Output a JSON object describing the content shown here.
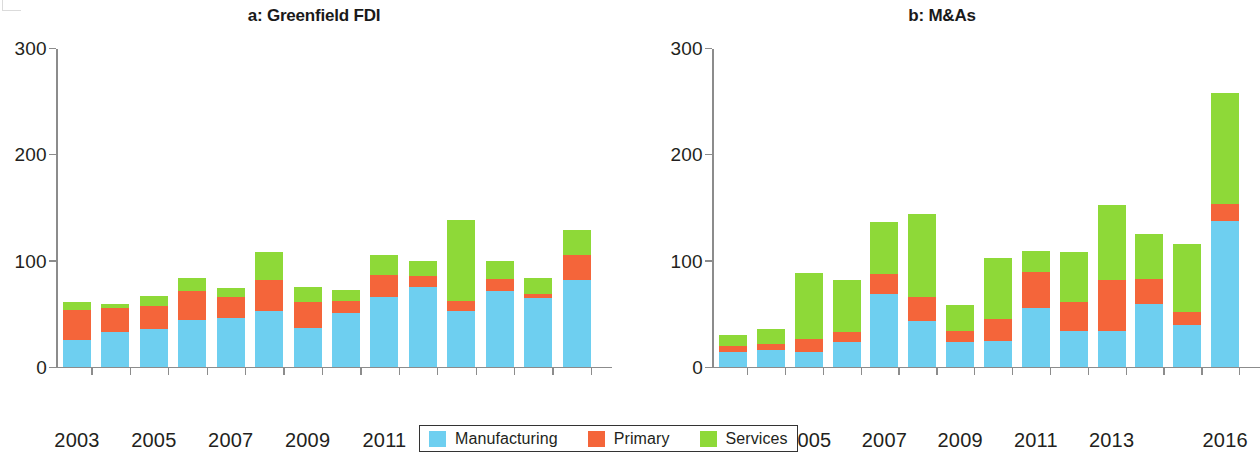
{
  "figure": {
    "panels": [
      {
        "id": "a",
        "title": "a: Greenfield FDI"
      },
      {
        "id": "b",
        "title": "b: M&As"
      }
    ]
  },
  "legend": {
    "items": [
      {
        "label": "Manufacturing",
        "color": "#6ecff0",
        "key": "manufacturing"
      },
      {
        "label": "Primary",
        "color": "#f4653a",
        "key": "primary"
      },
      {
        "label": "Services",
        "color": "#8ed938",
        "key": "services"
      }
    ]
  },
  "axis": {
    "y_ticks": [
      "0",
      "100",
      "200",
      "300"
    ],
    "y_values": [
      0,
      100,
      200,
      300
    ],
    "ylim": [
      0,
      300
    ],
    "x_tick_labels": [
      "2003",
      "2005",
      "2007",
      "2009",
      "2011",
      "2013",
      "2016"
    ]
  },
  "chart_data": [
    {
      "type": "bar",
      "stacked": true,
      "title": "a: Greenfield FDI",
      "xlabel": "",
      "ylabel": "",
      "ylim": [
        0,
        300
      ],
      "yticks": [
        0,
        100,
        200,
        300
      ],
      "grid": false,
      "legend_position": "bottom-center-shared",
      "categories": [
        "2003",
        "2004",
        "2005",
        "2006",
        "2007",
        "2008",
        "2009",
        "2010",
        "2011",
        "2012",
        "2013",
        "2014",
        "2015",
        "2016"
      ],
      "tick_labels_shown": [
        "2003",
        "",
        "2005",
        "",
        "2007",
        "",
        "2009",
        "",
        "2011",
        "",
        "2013",
        "",
        "",
        "2016"
      ],
      "series": [
        {
          "name": "Manufacturing",
          "color": "#6ecff0",
          "values": [
            25,
            32,
            35,
            44,
            46,
            52,
            36,
            50,
            65,
            75,
            52,
            71,
            64,
            81
          ]
        },
        {
          "name": "Primary",
          "color": "#f4653a",
          "values": [
            28,
            23,
            22,
            27,
            19,
            29,
            25,
            12,
            21,
            10,
            10,
            11,
            4,
            24
          ]
        },
        {
          "name": "Services",
          "color": "#8ed938",
          "values": [
            8,
            4,
            9,
            12,
            9,
            27,
            14,
            10,
            19,
            14,
            76,
            17,
            15,
            23
          ]
        }
      ],
      "totals": [
        61,
        59,
        66,
        83,
        74,
        108,
        75,
        72,
        105,
        99,
        138,
        99,
        83,
        128
      ]
    },
    {
      "type": "bar",
      "stacked": true,
      "title": "b: M&As",
      "xlabel": "",
      "ylabel": "",
      "ylim": [
        0,
        300
      ],
      "yticks": [
        0,
        100,
        200,
        300
      ],
      "grid": false,
      "legend_position": "bottom-center-shared",
      "categories": [
        "2003",
        "2004",
        "2005",
        "2006",
        "2007",
        "2008",
        "2009",
        "2010",
        "2011",
        "2012",
        "2013",
        "2014",
        "2015",
        "2016"
      ],
      "tick_labels_shown": [
        "2003",
        "",
        "2005",
        "",
        "2007",
        "",
        "2009",
        "",
        "2011",
        "",
        "2013",
        "",
        "",
        "2016"
      ],
      "series": [
        {
          "name": "Manufacturing",
          "color": "#6ecff0",
          "values": [
            14,
            16,
            14,
            23,
            68,
            43,
            23,
            24,
            55,
            33,
            33,
            59,
            39,
            137
          ]
        },
        {
          "name": "Primary",
          "color": "#f4653a",
          "values": [
            5,
            5,
            12,
            9,
            19,
            22,
            10,
            21,
            34,
            28,
            48,
            23,
            12,
            16
          ]
        },
        {
          "name": "Services",
          "color": "#8ed938",
          "values": [
            11,
            14,
            62,
            49,
            49,
            78,
            25,
            57,
            20,
            47,
            71,
            43,
            64,
            104
          ]
        }
      ],
      "totals": [
        30,
        35,
        88,
        81,
        136,
        143,
        58,
        102,
        109,
        108,
        152,
        125,
        115,
        257
      ]
    }
  ]
}
